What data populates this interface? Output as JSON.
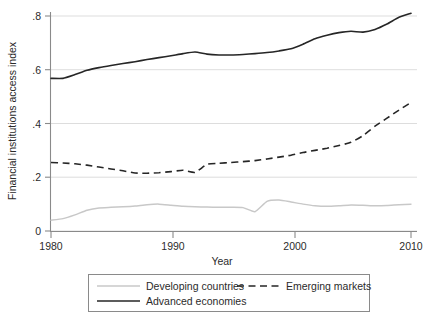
{
  "chart_data": {
    "type": "line",
    "title": "",
    "xlabel": "Year",
    "ylabel": "Financial institutions access index",
    "xlim": [
      1980,
      2010
    ],
    "ylim": [
      0,
      0.85
    ],
    "grid": true,
    "legend_position": "bottom",
    "xticks": [
      "1980",
      "1990",
      "2000",
      "2010"
    ],
    "xtick_values": [
      1980,
      1990,
      2000,
      2010
    ],
    "yticks": [
      "0",
      ".2",
      ".4",
      ".6",
      ".8"
    ],
    "ytick_values": [
      0,
      0.2,
      0.4,
      0.6,
      0.8
    ],
    "x": [
      1980,
      1981,
      1982,
      1983,
      1984,
      1985,
      1986,
      1987,
      1988,
      1989,
      1990,
      1991,
      1992,
      1993,
      1994,
      1995,
      1996,
      1997,
      1998,
      1999,
      2000,
      2001,
      2002,
      2003,
      2004,
      2005,
      2006,
      2007,
      2008,
      2009,
      2010
    ],
    "series": [
      {
        "name": "Developing countries",
        "style": "solid",
        "color": "#c8c8c8",
        "values": [
          0.04,
          0.046,
          0.06,
          0.077,
          0.086,
          0.088,
          0.09,
          0.093,
          0.098,
          0.1,
          0.096,
          0.092,
          0.09,
          0.089,
          0.088,
          0.088,
          0.087,
          0.072,
          0.11,
          0.115,
          0.108,
          0.1,
          0.094,
          0.092,
          0.094,
          0.097,
          0.096,
          0.094,
          0.095,
          0.098,
          0.1
        ]
      },
      {
        "name": "Emerging markets",
        "style": "dashed",
        "color": "#262626",
        "values": [
          0.255,
          0.253,
          0.25,
          0.245,
          0.238,
          0.231,
          0.224,
          0.216,
          0.215,
          0.217,
          0.221,
          0.226,
          0.218,
          0.248,
          0.252,
          0.255,
          0.258,
          0.262,
          0.268,
          0.275,
          0.282,
          0.292,
          0.3,
          0.308,
          0.318,
          0.33,
          0.355,
          0.39,
          0.42,
          0.45,
          0.478
        ]
      },
      {
        "name": "Advanced economies",
        "style": "solid",
        "color": "#262626",
        "values": [
          0.568,
          0.568,
          0.582,
          0.598,
          0.608,
          0.616,
          0.623,
          0.63,
          0.638,
          0.645,
          0.652,
          0.66,
          0.666,
          0.658,
          0.655,
          0.655,
          0.657,
          0.66,
          0.664,
          0.67,
          0.678,
          0.695,
          0.715,
          0.728,
          0.738,
          0.743,
          0.74,
          0.75,
          0.77,
          0.795,
          0.81
        ]
      }
    ],
    "developing_tail_note": "",
    "legend_entries": [
      {
        "label": "Developing countries",
        "style": "solid-light"
      },
      {
        "label": "Emerging markets",
        "style": "dashed"
      },
      {
        "label": "Advanced economies",
        "style": "solid-dark"
      }
    ]
  }
}
